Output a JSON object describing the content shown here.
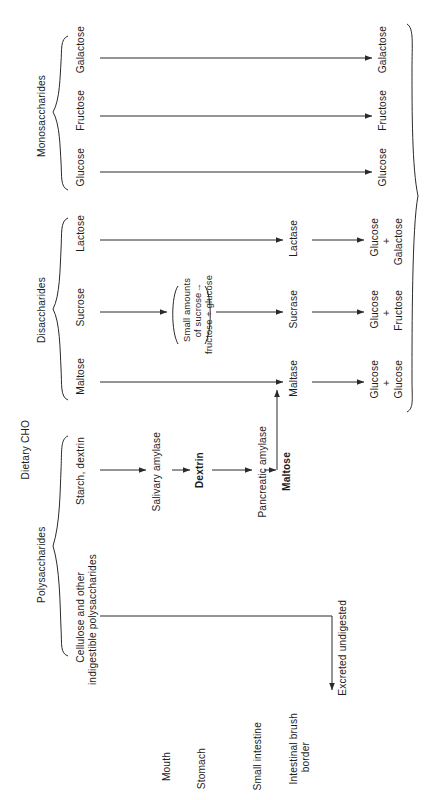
{
  "figure": {
    "title": "Dietary CHO",
    "groups": {
      "polysaccharides": "Polysaccharides",
      "disaccharides": "Disaccharides",
      "monosaccharides": "Monosaccharides"
    },
    "organs": [
      {
        "id": "mouth",
        "label": "Mouth"
      },
      {
        "id": "stomach",
        "label": "Stomach"
      },
      {
        "id": "small-intestine",
        "label": "Small intestine"
      },
      {
        "id": "intestinal-brush-border",
        "label": "Intestinal brush\nborder"
      }
    ],
    "polysaccharide_substrates": [
      {
        "id": "starch-dextrin",
        "label": "Starch, dextrin"
      },
      {
        "id": "cellulose",
        "label": "Cellulose and other\nindigestible polysaccharides"
      }
    ],
    "disaccharide_substrates": [
      {
        "id": "maltose",
        "label": "Maltose"
      },
      {
        "id": "sucrose",
        "label": "Sucrose"
      },
      {
        "id": "lactose",
        "label": "Lactose"
      }
    ],
    "monosaccharide_substrates": [
      {
        "id": "glucose",
        "label": "Glucose"
      },
      {
        "id": "fructose",
        "label": "Fructose"
      },
      {
        "id": "galactose",
        "label": "Galactose"
      }
    ],
    "enzymes": [
      {
        "id": "salivary-amylase",
        "label": "Salivary amylase"
      },
      {
        "id": "pancreatic-amylase",
        "label": "Pancreatic amylase"
      },
      {
        "id": "maltase",
        "label": "Maltase"
      },
      {
        "id": "sucrase",
        "label": "Sucrase"
      },
      {
        "id": "lactase",
        "label": "Lactase"
      }
    ],
    "products": [
      {
        "id": "dextrin",
        "label": "Dextrin",
        "bold": true
      },
      {
        "id": "maltose-product",
        "label": "Maltose",
        "bold": true
      }
    ],
    "brush_border_products": [
      {
        "id": "maltase-products",
        "line1": "Glucose",
        "plus": "+",
        "line2": "Glucose"
      },
      {
        "id": "sucrase-products",
        "line1": "Glucose",
        "plus": "+",
        "line2": "Fructose"
      },
      {
        "id": "lactase-products",
        "line1": "Glucose",
        "plus": "+",
        "line2": "Galactose"
      }
    ],
    "monosaccharide_outputs": [
      {
        "id": "glucose-out",
        "label": "Glucose"
      },
      {
        "id": "fructose-out",
        "label": "Fructose"
      },
      {
        "id": "galactose-out",
        "label": "Galactose"
      }
    ],
    "annotations": {
      "sucrose_note": "Small amounts\nof sucrose→\nfructose + glucose",
      "excreted": "Excreted undigested"
    }
  }
}
